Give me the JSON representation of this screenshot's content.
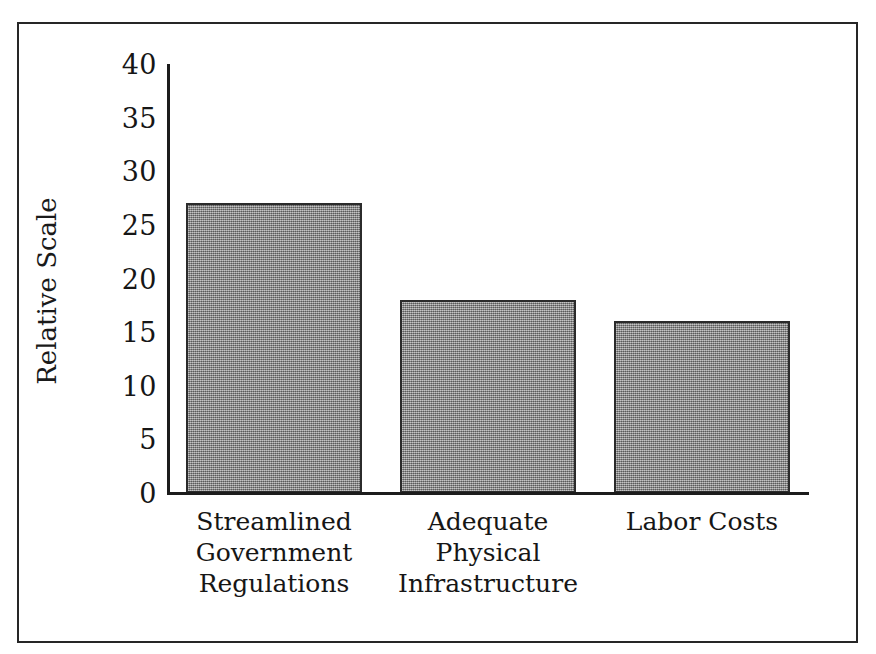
{
  "figure": {
    "background_color": "#ffffff",
    "frame_color": "#262626",
    "axis_color": "#1c1c1c",
    "bar_fill_color": "#8d8d8d",
    "bar_edge_color": "#2b2b2b",
    "text_color": "#161616"
  },
  "chart_data": {
    "type": "bar",
    "title": "",
    "subtitle": "",
    "xlabel": "",
    "ylabel": "Relative Scale",
    "categories": [
      "Streamlined Government Regulations",
      "Adequate Physical Infrastructure",
      "Labor Costs"
    ],
    "category_lines": [
      [
        "Streamlined",
        "Government",
        "Regulations"
      ],
      [
        "Adequate",
        "Physical",
        "Infrastructure"
      ],
      [
        "Labor Costs"
      ]
    ],
    "values": [
      27,
      18,
      16
    ],
    "ylim": [
      0,
      40
    ],
    "ytick_values": [
      0,
      5,
      10,
      15,
      20,
      25,
      30,
      35,
      40
    ],
    "ytick_labels": [
      "0",
      "5",
      "10",
      "15",
      "20",
      "25",
      "30",
      "35",
      "40"
    ],
    "ytick_step": 5,
    "grid": false,
    "legend": false,
    "legend_position": "none",
    "annotations": []
  }
}
